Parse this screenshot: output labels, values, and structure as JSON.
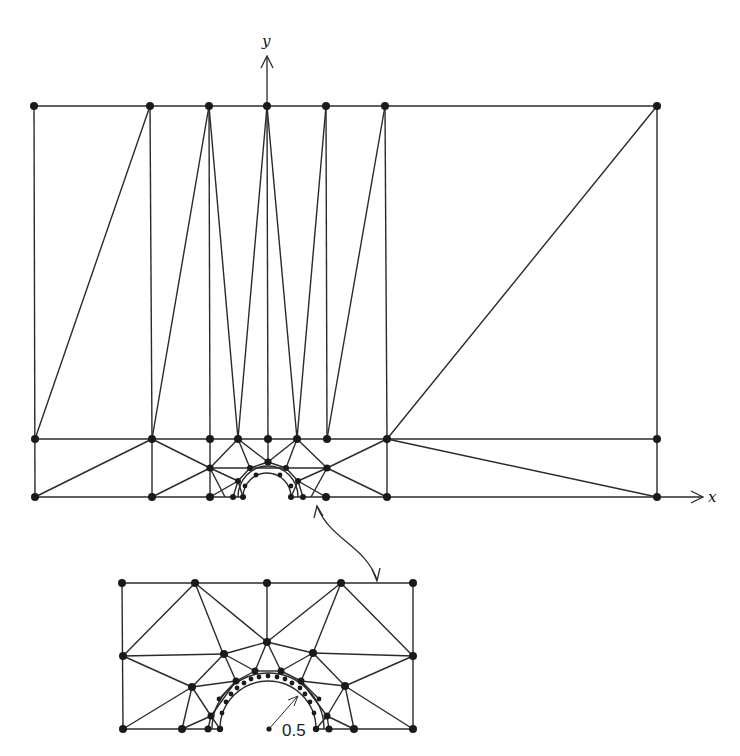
{
  "figure": {
    "axes": {
      "x_label": "x",
      "y_label": "y"
    },
    "inset": {
      "radius_label": "0.5"
    },
    "colors": {
      "line": "#2a2a2a",
      "node": "#1a1a1a",
      "background": "#ffffff"
    }
  },
  "main_mesh": {
    "top_row_x": [
      34,
      150,
      209,
      267,
      326,
      385,
      657
    ],
    "top_row_y": 106,
    "middle_row_x": [
      35,
      152,
      210,
      238,
      268,
      297,
      327,
      387,
      657
    ],
    "middle_row_y": 439,
    "bottom_row_x": [
      35,
      152,
      210,
      387,
      657
    ],
    "bottom_row_y": 497,
    "hole_center": [
      267,
      497
    ],
    "hole_radius_px": 24
  },
  "inset_mesh": {
    "top_row_x": [
      122,
      195,
      267,
      341,
      413
    ],
    "top_row_y": 583,
    "bottom_row_y": 729,
    "center": [
      267,
      729
    ],
    "hole_radius_px": 78
  }
}
